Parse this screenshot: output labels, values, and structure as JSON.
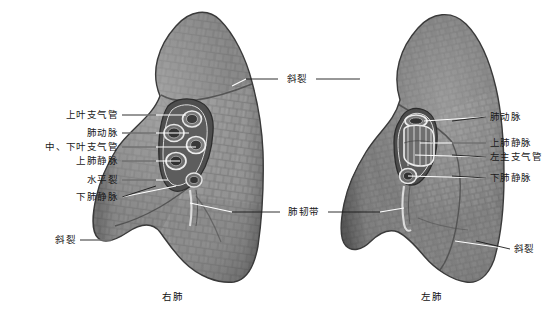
{
  "figure": {
    "title_visible": false,
    "background_color": "#ffffff",
    "ink_color": "#1a1a1a"
  },
  "captions": [
    {
      "text": "右肺",
      "x": 173,
      "y": 296
    },
    {
      "text": "左肺",
      "x": 432,
      "y": 296
    }
  ],
  "labels_left": [
    {
      "id": "upper-lobe-bronchus",
      "text": "上叶支气管",
      "tx": 118,
      "ty": 115,
      "lx1": 122,
      "ly1": 115,
      "lx2": 186,
      "ly2": 115
    },
    {
      "id": "pulmonary-artery-r",
      "text": "肺动脉",
      "tx": 118,
      "ty": 133,
      "lx1": 122,
      "ly1": 133,
      "lx2": 189,
      "ly2": 133
    },
    {
      "id": "mid-lower-bronchus",
      "text": "中、下叶支气管",
      "tx": 118,
      "ty": 147,
      "lx1": 122,
      "ly1": 147,
      "lx2": 196,
      "ly2": 147
    },
    {
      "id": "superior-pulm-vein-r",
      "text": "上肺静脉",
      "tx": 118,
      "ty": 161,
      "lx1": 122,
      "ly1": 161,
      "lx2": 180,
      "ly2": 161
    },
    {
      "id": "horizontal-fissure",
      "text": "水平裂",
      "tx": 118,
      "ty": 180,
      "lx1": 122,
      "ly1": 180,
      "lx2": 168,
      "ly2": 180
    },
    {
      "id": "inferior-pulm-vein-r",
      "text": "下肺静脉",
      "tx": 118,
      "ty": 197,
      "lx1": 122,
      "ly1": 197,
      "lx2": 176,
      "ly2": 186
    },
    {
      "id": "oblique-fissure-rl",
      "text": "斜裂",
      "tx": 76,
      "ty": 240,
      "lx1": 80,
      "ly1": 240,
      "lx2": 112,
      "ly2": 240
    }
  ],
  "labels_center": [
    {
      "id": "oblique-fissure-top",
      "text": "斜裂",
      "tx": 297,
      "ty": 79,
      "leader_left": {
        "x1": 278,
        "y1": 79,
        "x2": 246,
        "y2": 79,
        "x3": 232,
        "y3": 86
      },
      "leader_right": {
        "x1": 316,
        "y1": 79,
        "x2": 360,
        "y2": 79,
        "x3": 372,
        "y3": 86
      }
    },
    {
      "id": "pulmonary-ligament",
      "text": "肺韧带",
      "tx": 304,
      "ty": 212,
      "leader_left": {
        "x1": 280,
        "y1": 212,
        "x2": 232,
        "y2": 212,
        "x3": 190,
        "y3": 203
      },
      "leader_right": {
        "x1": 328,
        "y1": 212,
        "x2": 380,
        "y2": 212,
        "x3": 404,
        "y3": 208
      }
    }
  ],
  "labels_right": [
    {
      "id": "pulmonary-artery-l",
      "text": "肺动脉",
      "tx": 490,
      "ty": 117,
      "lx1": 486,
      "ly1": 117,
      "lx2": 424,
      "ly2": 121
    },
    {
      "id": "superior-pulm-vein-l",
      "text": "上肺静脉",
      "tx": 490,
      "ty": 143,
      "lx1": 486,
      "ly1": 143,
      "lx2": 420,
      "ly2": 143
    },
    {
      "id": "left-main-bronchus",
      "text": "左主支气管",
      "tx": 490,
      "ty": 157,
      "lx1": 486,
      "ly1": 157,
      "lx2": 415,
      "ly2": 155
    },
    {
      "id": "inferior-pulm-vein-l",
      "text": "下肺静脉",
      "tx": 490,
      "ty": 178,
      "lx1": 486,
      "ly1": 178,
      "lx2": 408,
      "ly2": 176
    },
    {
      "id": "oblique-fissure-ll",
      "text": "斜裂",
      "tx": 514,
      "ty": 249,
      "lx1": 510,
      "ly1": 249,
      "lx2": 455,
      "ly2": 241
    }
  ],
  "anatomy": {
    "right_lung": {
      "name": "右肺",
      "lobes": [
        "上叶",
        "中叶",
        "下叶"
      ],
      "hilum_structures": [
        "上叶支气管",
        "肺动脉",
        "中、下叶支气管",
        "上肺静脉",
        "下肺静脉"
      ]
    },
    "left_lung": {
      "name": "左肺",
      "lobes": [
        "上叶",
        "下叶"
      ],
      "hilum_structures": [
        "肺动脉",
        "上肺静脉",
        "左主支气管",
        "下肺静脉"
      ]
    }
  }
}
